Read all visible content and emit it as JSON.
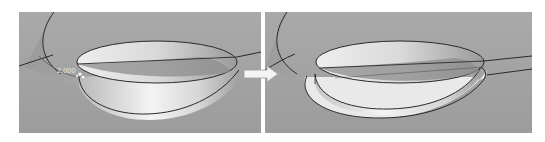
{
  "figure": {
    "panels": [
      {
        "id": "before",
        "label": "Before offset"
      },
      {
        "id": "after",
        "label": "After offset"
      }
    ],
    "dimension_label": "2.000",
    "arrow_icon": "right-arrow-icon",
    "colors": {
      "background": "#ffffff",
      "viewport": "#a6a6a6",
      "surface_light": "#f2f2f2",
      "surface_dark": "#8e8e8e",
      "edge": "#2a2a2a",
      "arrow": "#f4f4f4"
    }
  }
}
